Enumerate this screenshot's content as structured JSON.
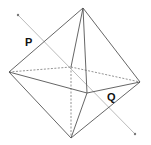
{
  "diagram": {
    "type": "octahedron-with-axis",
    "background": "#ffffff",
    "colors": {
      "edge": "#555555",
      "hidden_edge": "#777777",
      "axis": "#bbbbbb",
      "axis_endpoint": "#777777",
      "label": "#111111"
    },
    "vertices": {
      "top": {
        "x": 83,
        "y": 8
      },
      "left": {
        "x": 9,
        "y": 72
      },
      "right": {
        "x": 140,
        "y": 82
      },
      "bottom": {
        "x": 71,
        "y": 138
      },
      "back": {
        "x": 71,
        "y": 67
      },
      "front": {
        "x": 87,
        "y": 93
      }
    },
    "axis": {
      "x1": 18,
      "y1": 15,
      "x2": 135,
      "y2": 134
    },
    "labels": [
      {
        "text": "P",
        "x": 25,
        "y": 46
      },
      {
        "text": "Q",
        "x": 107,
        "y": 101
      }
    ]
  }
}
